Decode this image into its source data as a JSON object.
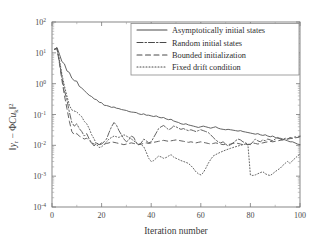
{
  "chart_data": {
    "type": "line",
    "title": "",
    "xlabel": "Iteration number",
    "ylabel": "||y_r - ΦCu_k||²",
    "ylabel_parts": {
      "norm_open": "‖",
      "y": "y",
      "y_sub": "r",
      "minus": "−",
      "phi": "Φ",
      "c": "C",
      "u": "u",
      "u_sub": "k",
      "norm_close": "‖",
      "sup": "2"
    },
    "xlim": [
      0,
      100
    ],
    "ylim": [
      0.0001,
      100
    ],
    "yscale": "log",
    "xscale": "linear",
    "grid": false,
    "xticks": [
      0,
      20,
      40,
      60,
      80,
      100
    ],
    "xticklabels": [
      "0",
      "20",
      "40",
      "60",
      "80",
      "100"
    ],
    "yticks": [
      0.0001,
      0.001,
      0.01,
      0.1,
      1,
      10,
      100
    ],
    "yticklabels": [
      "10-4",
      "10-3",
      "10-2",
      "10-1",
      "100",
      "101",
      "102"
    ],
    "ytick_mantissa": "10",
    "ytick_exponents": [
      "-4",
      "-3",
      "-2",
      "-1",
      "0",
      "1",
      "2"
    ],
    "legend_position": "upper right",
    "series": [
      {
        "name": "Asymptotically initial states",
        "style": "solid",
        "dash": "none",
        "color": "#555555",
        "x": [
          1,
          2,
          3,
          4,
          5,
          6,
          7,
          8,
          9,
          10,
          11,
          12,
          13,
          14,
          15,
          16,
          17,
          18,
          19,
          20,
          21,
          22,
          23,
          24,
          25,
          26,
          27,
          28,
          29,
          30,
          31,
          32,
          33,
          34,
          35,
          36,
          37,
          38,
          39,
          40,
          41,
          42,
          43,
          44,
          45,
          46,
          47,
          48,
          49,
          50,
          51,
          52,
          53,
          54,
          55,
          56,
          57,
          58,
          59,
          60,
          61,
          62,
          63,
          64,
          65,
          66,
          67,
          68,
          69,
          70,
          71,
          72,
          73,
          74,
          75,
          76,
          77,
          78,
          79,
          80,
          81,
          82,
          83,
          84,
          85,
          86,
          87,
          88,
          89,
          90,
          91,
          92,
          93,
          94,
          95,
          96,
          97,
          98,
          99,
          100
        ],
        "y": [
          13.0,
          15.0,
          9.0,
          5.2,
          4.4,
          2.6,
          2.3,
          1.5,
          1.25,
          1.2,
          0.82,
          0.72,
          0.6,
          0.5,
          0.42,
          0.38,
          0.32,
          0.3,
          0.25,
          0.24,
          0.2,
          0.195,
          0.185,
          0.17,
          0.175,
          0.16,
          0.155,
          0.145,
          0.14,
          0.135,
          0.125,
          0.12,
          0.118,
          0.115,
          0.105,
          0.1,
          0.105,
          0.095,
          0.095,
          0.09,
          0.086,
          0.09,
          0.082,
          0.078,
          0.08,
          0.072,
          0.068,
          0.07,
          0.062,
          0.058,
          0.055,
          0.05,
          0.048,
          0.05,
          0.046,
          0.044,
          0.042,
          0.04,
          0.038,
          0.04,
          0.042,
          0.04,
          0.038,
          0.036,
          0.038,
          0.04,
          0.036,
          0.034,
          0.033,
          0.032,
          0.033,
          0.032,
          0.031,
          0.03,
          0.029,
          0.03,
          0.028,
          0.027,
          0.026,
          0.025,
          0.024,
          0.023,
          0.024,
          0.022,
          0.021,
          0.022,
          0.02,
          0.019,
          0.02,
          0.018,
          0.017,
          0.017,
          0.016,
          0.015,
          0.014,
          0.013,
          0.013,
          0.012,
          0.011,
          0.0105
        ]
      },
      {
        "name": "Random initial states",
        "style": "dash-dot",
        "dash": "6,2,1.5,2",
        "color": "#4a4a4a",
        "x": [
          1,
          2,
          3,
          4,
          5,
          6,
          7,
          8,
          9,
          10,
          11,
          12,
          13,
          14,
          15,
          16,
          17,
          18,
          19,
          20,
          21,
          22,
          23,
          24,
          25,
          26,
          27,
          28,
          29,
          30,
          31,
          32,
          33,
          34,
          35,
          36,
          37,
          38,
          39,
          40,
          41,
          42,
          43,
          44,
          45,
          46,
          47,
          48,
          49,
          50,
          51,
          52,
          53,
          54,
          55,
          56,
          57,
          58,
          59,
          60,
          61,
          62,
          63,
          64,
          65,
          66,
          67,
          68,
          69,
          70,
          71,
          72,
          73,
          74,
          75,
          76,
          77,
          78,
          79,
          80,
          81,
          82,
          83,
          84,
          85,
          86,
          87,
          88,
          89,
          90,
          91,
          92,
          93,
          94,
          95,
          96,
          97,
          98,
          99,
          100
        ],
        "y": [
          13.0,
          14.0,
          5.0,
          1.6,
          0.6,
          0.3,
          0.12,
          0.055,
          0.042,
          0.05,
          0.035,
          0.028,
          0.02,
          0.024,
          0.016,
          0.012,
          0.0095,
          0.012,
          0.0105,
          0.011,
          0.013,
          0.016,
          0.026,
          0.04,
          0.055,
          0.045,
          0.03,
          0.022,
          0.016,
          0.013,
          0.015,
          0.02,
          0.018,
          0.012,
          0.0105,
          0.012,
          0.016,
          0.014,
          0.012,
          0.013,
          0.018,
          0.025,
          0.035,
          0.04,
          0.044,
          0.038,
          0.032,
          0.035,
          0.042,
          0.04,
          0.036,
          0.033,
          0.035,
          0.032,
          0.03,
          0.032,
          0.03,
          0.028,
          0.03,
          0.032,
          0.03,
          0.028,
          0.026,
          0.022,
          0.018,
          0.015,
          0.013,
          0.012,
          0.013,
          0.011,
          0.0095,
          0.0105,
          0.012,
          0.014,
          0.016,
          0.015,
          0.013,
          0.012,
          0.011,
          0.0105,
          0.013,
          0.016,
          0.014,
          0.013,
          0.015,
          0.014,
          0.016,
          0.015,
          0.014,
          0.016,
          0.018,
          0.016,
          0.015,
          0.017,
          0.016,
          0.018,
          0.017,
          0.019,
          0.018,
          0.02
        ]
      },
      {
        "name": "Bounded initialization",
        "style": "dashed",
        "dash": "5,3.5",
        "color": "#4f4f4f",
        "x": [
          1,
          2,
          3,
          4,
          5,
          6,
          7,
          8,
          9,
          10,
          11,
          12,
          13,
          14,
          15,
          16,
          17,
          18,
          19,
          20,
          21,
          22,
          23,
          24,
          25,
          26,
          27,
          28,
          29,
          30,
          31,
          32,
          33,
          34,
          35,
          36,
          37,
          38,
          39,
          40,
          41,
          42,
          43,
          44,
          45,
          46,
          47,
          48,
          49,
          50,
          51,
          52,
          53,
          54,
          55,
          56,
          57,
          58,
          59,
          60,
          61,
          62,
          63,
          64,
          65,
          66,
          67,
          68,
          69,
          70,
          71,
          72,
          73,
          74,
          75,
          76,
          77,
          78,
          79,
          80,
          81,
          82,
          83,
          84,
          85,
          86,
          87,
          88,
          89,
          90,
          91,
          92,
          93,
          94,
          95,
          96,
          97,
          98,
          99,
          100
        ],
        "y": [
          13.0,
          14.0,
          4.5,
          1.3,
          0.42,
          0.16,
          0.06,
          0.028,
          0.022,
          0.024,
          0.02,
          0.018,
          0.016,
          0.017,
          0.014,
          0.012,
          0.011,
          0.0115,
          0.0105,
          0.012,
          0.011,
          0.0115,
          0.012,
          0.013,
          0.0125,
          0.012,
          0.0115,
          0.011,
          0.0105,
          0.011,
          0.0115,
          0.012,
          0.0115,
          0.011,
          0.0105,
          0.011,
          0.0115,
          0.012,
          0.0115,
          0.012,
          0.0125,
          0.013,
          0.0135,
          0.014,
          0.0145,
          0.014,
          0.0135,
          0.014,
          0.0145,
          0.015,
          0.0145,
          0.014,
          0.0135,
          0.013,
          0.0125,
          0.013,
          0.0125,
          0.012,
          0.0125,
          0.013,
          0.0125,
          0.012,
          0.0115,
          0.011,
          0.0115,
          0.012,
          0.0115,
          0.011,
          0.0105,
          0.011,
          0.0105,
          0.011,
          0.0115,
          0.012,
          0.0115,
          0.011,
          0.0105,
          0.011,
          0.0105,
          0.011,
          0.012,
          0.0115,
          0.011,
          0.0115,
          0.012,
          0.0125,
          0.013,
          0.0135,
          0.013,
          0.0135,
          0.014,
          0.0145,
          0.015,
          0.0155,
          0.016,
          0.0165,
          0.017,
          0.0175,
          0.018,
          0.019
        ]
      },
      {
        "name": "Fixed drift condition",
        "style": "dotted",
        "dash": "1,2",
        "color": "#6a6a6a",
        "x": [
          1,
          2,
          3,
          4,
          5,
          6,
          7,
          8,
          9,
          10,
          11,
          12,
          13,
          14,
          15,
          16,
          17,
          18,
          19,
          20,
          21,
          22,
          23,
          24,
          25,
          26,
          27,
          28,
          29,
          30,
          31,
          32,
          33,
          34,
          35,
          36,
          37,
          38,
          39,
          40,
          41,
          42,
          43,
          44,
          45,
          46,
          47,
          48,
          49,
          50,
          51,
          52,
          53,
          54,
          55,
          56,
          57,
          58,
          59,
          60,
          61,
          62,
          63,
          64,
          65,
          66,
          67,
          68,
          69,
          70,
          71,
          72,
          73,
          74,
          75,
          76,
          77,
          78,
          79,
          80,
          81,
          82,
          83,
          84,
          85,
          86,
          87,
          88,
          89,
          90,
          91,
          92,
          93,
          94,
          95,
          96,
          97,
          98,
          99,
          100
        ],
        "y": [
          13.0,
          14.0,
          6.0,
          2.0,
          0.85,
          0.4,
          0.2,
          0.14,
          0.13,
          0.12,
          0.1,
          0.085,
          0.06,
          0.05,
          0.035,
          0.022,
          0.016,
          0.0105,
          0.0085,
          0.009,
          0.0105,
          0.013,
          0.016,
          0.018,
          0.02,
          0.019,
          0.018,
          0.02,
          0.022,
          0.02,
          0.018,
          0.016,
          0.014,
          0.012,
          0.011,
          0.0105,
          0.009,
          0.006,
          0.0038,
          0.003,
          0.0032,
          0.0038,
          0.0045,
          0.0042,
          0.0038,
          0.004,
          0.0045,
          0.005,
          0.0042,
          0.0038,
          0.0035,
          0.0032,
          0.003,
          0.0028,
          0.0026,
          0.0022,
          0.0018,
          0.0014,
          0.0012,
          0.0011,
          0.0013,
          0.0018,
          0.0026,
          0.0035,
          0.0045,
          0.005,
          0.0055,
          0.006,
          0.0065,
          0.007,
          0.0075,
          0.008,
          0.0085,
          0.009,
          0.0095,
          0.01,
          0.0105,
          0.011,
          0.0105,
          0.0011,
          0.00105,
          0.0011,
          0.0012,
          0.0013,
          0.0014,
          0.0012,
          0.0011,
          0.00105,
          0.0012,
          0.0014,
          0.0016,
          0.0018,
          0.0022,
          0.0026,
          0.003,
          0.0026,
          0.0032,
          0.0038,
          0.0045,
          0.0052
        ]
      }
    ]
  },
  "legend": {
    "items": [
      "Asymptotically initial states",
      "Random initial states",
      "Bounded initialization",
      "Fixed drift condition"
    ]
  }
}
